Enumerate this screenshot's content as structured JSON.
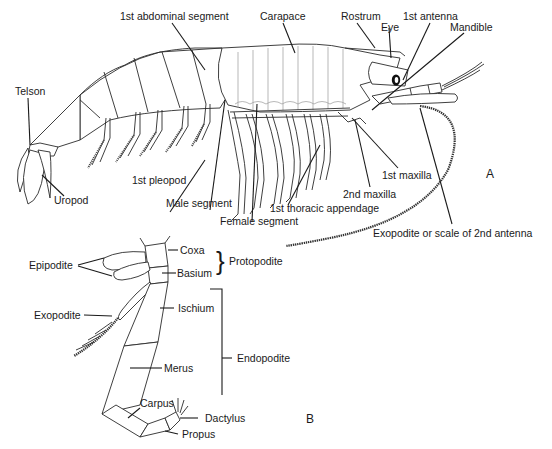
{
  "figure": {
    "panel_a": {
      "panel_label": "A",
      "labels": {
        "abdominal_segment": "1st abdominal segment",
        "carapace": "Carapace",
        "rostrum": "Rostrum",
        "eye": "Eye",
        "antenna1": "1st antenna",
        "mandible": "Mandible",
        "telson": "Telson",
        "uropod": "Uropod",
        "pleopod": "1st pleopod",
        "male_segment": "Male segment",
        "female_segment": "Female segment",
        "thoracic_appendage": "1st thoracic appendage",
        "maxilla2": "2nd maxilla",
        "maxilla1": "1st maxilla",
        "exopodite_antenna": "Exopodite or scale of 2nd antenna"
      }
    },
    "panel_b": {
      "panel_label": "B",
      "labels": {
        "epipodite": "Epipodite",
        "coxa": "Coxa",
        "basium": "Basium",
        "protopodite": "Protopodite",
        "exopodite": "Exopodite",
        "ischium": "Ischium",
        "endopodite": "Endopodite",
        "merus": "Merus",
        "carpus": "Carpus",
        "dactylus": "Dactylus",
        "propus": "Propus"
      },
      "brackets": {
        "protopodite": "}"
      }
    }
  }
}
